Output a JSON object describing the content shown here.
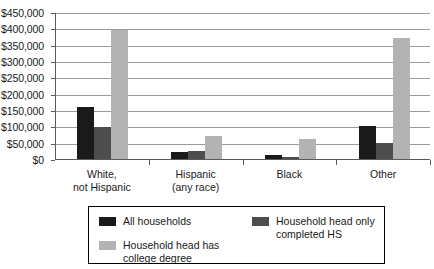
{
  "chart_data": {
    "type": "bar",
    "title": "",
    "xlabel": "",
    "ylabel": "",
    "ylim": [
      0,
      450000
    ],
    "grid": true,
    "legend_position": "bottom",
    "categories": [
      "White,\nnot Hispanic",
      "Hispanic\n(any race)",
      "Black",
      "Other"
    ],
    "category_lines": [
      [
        "White,",
        "not Hispanic"
      ],
      [
        "Hispanic",
        "(any race)"
      ],
      [
        "Black"
      ],
      [
        "Other"
      ]
    ],
    "series": [
      {
        "name": "All households",
        "color": "#1a1a1a",
        "values": [
          160000,
          20000,
          13000,
          100000
        ]
      },
      {
        "name": "Household head only completed HS",
        "legend_lines": [
          "Household head only",
          "completed HS"
        ],
        "color": "#4d4d4d",
        "values": [
          98000,
          25000,
          5000,
          50000
        ]
      },
      {
        "name": "Household head has college degree",
        "legend_lines": [
          "Household head has",
          "college degree"
        ],
        "color": "#b3b3b3",
        "values": [
          395000,
          70000,
          60000,
          370000
        ]
      }
    ],
    "y_ticks": [
      0,
      50000,
      100000,
      150000,
      200000,
      250000,
      300000,
      350000,
      400000,
      450000
    ],
    "y_tick_labels": [
      "$0",
      "$50,000",
      "$100,000",
      "$150,000",
      "$200,000",
      "$250,000",
      "$300,000",
      "$350,000",
      "$400,000",
      "$450,000"
    ]
  },
  "legend": {
    "entries": [
      {
        "label": "All households",
        "lines": [
          "All households"
        ],
        "color": "#1a1a1a"
      },
      {
        "label": "Household head only completed HS",
        "lines": [
          "Household head only",
          "completed HS"
        ],
        "color": "#4d4d4d"
      },
      {
        "label": "Household head has college degree",
        "lines": [
          "Household head has",
          "college degree"
        ],
        "color": "#b3b3b3"
      }
    ]
  },
  "colors": {
    "series_all_households": "#1a1a1a",
    "series_hs": "#4d4d4d",
    "series_college": "#b3b3b3",
    "gridline": "#9a9a9a",
    "axis": "#5a5a5a",
    "background": "#ffffff",
    "text": "#1a1a1a"
  }
}
